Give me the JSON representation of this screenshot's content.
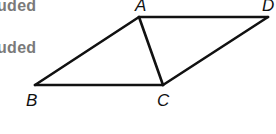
{
  "side_text": {
    "line1": "uded",
    "line2": "uded"
  },
  "diagram": {
    "shape": "parallelogram ABCD with diagonal AC",
    "stroke_color": "#111111",
    "vertices": {
      "A": {
        "label": "A",
        "x": 139,
        "y": 17
      },
      "D": {
        "label": "D",
        "x": 268,
        "y": 17
      },
      "B": {
        "label": "B",
        "x": 35,
        "y": 85
      },
      "C": {
        "label": "C",
        "x": 163,
        "y": 85
      }
    },
    "edges": [
      "AD",
      "DC",
      "CB",
      "BA",
      "AC"
    ]
  }
}
